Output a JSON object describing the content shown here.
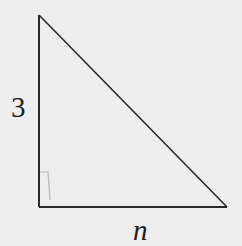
{
  "diagram": {
    "type": "right-triangle",
    "vertices": {
      "top": [
        39,
        15
      ],
      "right_angle": [
        39,
        207
      ],
      "bottom_right": [
        227,
        207
      ]
    },
    "sides": {
      "vertical_leg_label": "3",
      "horizontal_leg_label": "n"
    },
    "right_angle_marker": true,
    "colors": {
      "stroke": "#2a2a2a",
      "background": "#eeeeee",
      "marker": "#b0b0b0"
    }
  }
}
